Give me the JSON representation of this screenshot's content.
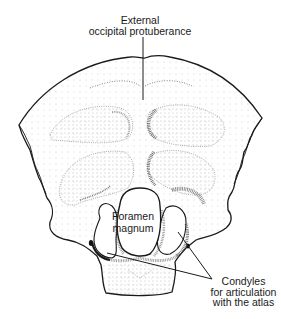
{
  "figure": {
    "labels": {
      "protuberance": {
        "line1": "External",
        "line2": "occipital protuberance"
      },
      "foramen": {
        "line1": "Foramen",
        "line2": "magnum"
      },
      "condyles": {
        "line1": "Condyles",
        "line2": "for articulation",
        "line3": "with the atlas"
      }
    },
    "colors": {
      "outline": "#1a1a1a",
      "stipple": "#555555",
      "background": "#ffffff"
    }
  }
}
